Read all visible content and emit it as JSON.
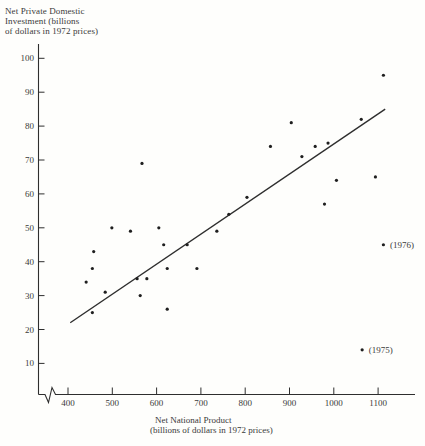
{
  "chart_data": {
    "type": "scatter",
    "title": "",
    "ylabel": "Net Private Domestic Investment (billions of dollars in 1972 prices)",
    "ylabel_lines": [
      "Net Private Domestic",
      "Investment (billions",
      "of dollars in 1972 prices)"
    ],
    "xlabel": "Net National Product (billions of dollars in 1972 prices)",
    "xlabel_lines": [
      "Net National Product",
      "(billions of dollars in 1972 prices)"
    ],
    "xlim": [
      400,
      1150
    ],
    "ylim": [
      0,
      105
    ],
    "x_ticks": [
      400,
      500,
      600,
      700,
      800,
      900,
      1000,
      1100
    ],
    "y_ticks": [
      10,
      20,
      30,
      40,
      50,
      60,
      70,
      80,
      90,
      100
    ],
    "grid": false,
    "legend": false,
    "x_axis_break": true,
    "points": [
      {
        "x": 441,
        "y": 34
      },
      {
        "x": 455,
        "y": 25
      },
      {
        "x": 455,
        "y": 38
      },
      {
        "x": 458,
        "y": 43
      },
      {
        "x": 484,
        "y": 31
      },
      {
        "x": 499,
        "y": 50
      },
      {
        "x": 541,
        "y": 49
      },
      {
        "x": 556,
        "y": 35
      },
      {
        "x": 563,
        "y": 30
      },
      {
        "x": 567,
        "y": 69
      },
      {
        "x": 578,
        "y": 35
      },
      {
        "x": 605,
        "y": 50
      },
      {
        "x": 616,
        "y": 45
      },
      {
        "x": 624,
        "y": 26
      },
      {
        "x": 624,
        "y": 38
      },
      {
        "x": 669,
        "y": 45
      },
      {
        "x": 691,
        "y": 38
      },
      {
        "x": 736,
        "y": 49
      },
      {
        "x": 763,
        "y": 54
      },
      {
        "x": 804,
        "y": 59
      },
      {
        "x": 857,
        "y": 74
      },
      {
        "x": 904,
        "y": 81
      },
      {
        "x": 928,
        "y": 71
      },
      {
        "x": 958,
        "y": 74
      },
      {
        "x": 979,
        "y": 57
      },
      {
        "x": 987,
        "y": 75
      },
      {
        "x": 1006,
        "y": 64
      },
      {
        "x": 1062,
        "y": 82
      },
      {
        "x": 1094,
        "y": 65
      },
      {
        "x": 1112,
        "y": 95
      },
      {
        "x": 1112,
        "y": 45,
        "label": "(1976)"
      },
      {
        "x": 1064,
        "y": 14,
        "label": "(1975)"
      }
    ],
    "trend_line": {
      "x1": 405,
      "y1": 22,
      "x2": 1116,
      "y2": 85
    },
    "colors": {
      "ink": "#2e2e2e",
      "dot": "#1f1f1f",
      "text": "#3a3a3a",
      "background": "#fefefc"
    }
  }
}
